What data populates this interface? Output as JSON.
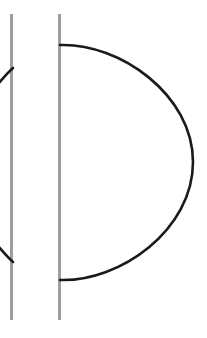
{
  "figure": {
    "canvas": {
      "width": 207,
      "height": 338,
      "background_color": "#ffffff"
    },
    "colors": {
      "guide_line": "#9e9e9e",
      "arc_stroke": "#1a1a1a",
      "background": "#ffffff"
    },
    "guide_lines": [
      {
        "name": "left-guide-line",
        "x": 11.5,
        "y_start": 14,
        "y_end": 320,
        "stroke_width": 3,
        "color": "#9e9e9e"
      },
      {
        "name": "right-guide-line",
        "x": 59.5,
        "y_start": 14,
        "y_end": 320,
        "stroke_width": 3,
        "color": "#9e9e9e"
      }
    ],
    "arcs": [
      {
        "name": "main-arc",
        "description": "Large D-shaped arc bulging to the right",
        "path": "M 60 45 C 120 43 193 95 193 162 C 193 230 120 282 60 280",
        "start_point": [
          60,
          45
        ],
        "end_point": [
          60,
          280
        ],
        "apex_point": [
          193,
          162
        ],
        "stroke_width": 2.6,
        "color": "#1a1a1a"
      },
      {
        "name": "upper-left-arc-fragment",
        "description": "Clipped arc fragment meeting the left guide line from below-left",
        "path": "M -12 96 C -2 84 6 74 13 68",
        "start_point": [
          -12,
          96
        ],
        "end_point": [
          13,
          68
        ],
        "stroke_width": 2.6,
        "color": "#1a1a1a"
      },
      {
        "name": "lower-left-arc-fragment",
        "description": "Clipped arc fragment meeting the left guide line from above-left",
        "path": "M -12 234 C -2 246 6 256 13 262",
        "start_point": [
          -12,
          234
        ],
        "end_point": [
          13,
          262
        ],
        "stroke_width": 2.6,
        "color": "#1a1a1a"
      }
    ]
  }
}
